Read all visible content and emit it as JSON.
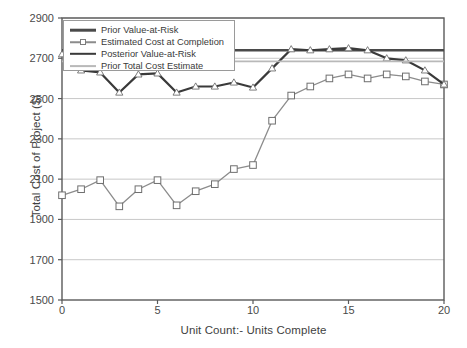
{
  "chart_data": {
    "type": "line",
    "title": "",
    "xlabel": "Unit Count:- Units Complete",
    "ylabel": "Total Cost of Project ($)",
    "xlim": [
      0,
      20
    ],
    "ylim": [
      1500,
      2900
    ],
    "xticks": [
      0,
      5,
      10,
      15,
      20
    ],
    "yticks": [
      1500,
      1700,
      1900,
      2100,
      2300,
      2500,
      2700,
      2900
    ],
    "grid": true,
    "legend_position": "top-left",
    "x": [
      0,
      1,
      2,
      3,
      4,
      5,
      6,
      7,
      8,
      9,
      10,
      11,
      12,
      13,
      14,
      15,
      16,
      17,
      18,
      19,
      20
    ],
    "series": [
      {
        "name": "Prior Value-at-Risk",
        "type": "hline",
        "marker": "none",
        "color": "#4a4a4a",
        "width": 2.4,
        "value": 2740
      },
      {
        "name": "Estimated Cost at Completion",
        "type": "line",
        "marker": "square",
        "color": "#8c8c8c",
        "width": 1.3,
        "values": [
          2020,
          2050,
          2095,
          1965,
          2050,
          2095,
          1970,
          2040,
          2075,
          2150,
          2170,
          2390,
          2515,
          2560,
          2600,
          2620,
          2600,
          2620,
          2610,
          2585,
          2570
        ]
      },
      {
        "name": "Posterior Value-at-Risk",
        "type": "line",
        "marker": "triangle",
        "color": "#3a3a3a",
        "width": 2.2,
        "values": [
          2720,
          2640,
          2630,
          2530,
          2620,
          2625,
          2530,
          2560,
          2560,
          2580,
          2555,
          2650,
          2745,
          2740,
          2745,
          2750,
          2740,
          2700,
          2690,
          2640,
          2570
        ]
      },
      {
        "name": "Prior Total Cost Estimate",
        "type": "hline",
        "marker": "none",
        "color": "#b9b9b9",
        "width": 1.8,
        "value": 2685
      }
    ]
  },
  "plot": {
    "left": 62,
    "right": 444,
    "top": 18,
    "bottom": 300,
    "axis_color": "#5a5a5a",
    "grid_color": "#c8c8c8",
    "background": "#ffffff"
  },
  "legend": {
    "items": [
      "Prior Value-at-Risk",
      "Estimated Cost at Completion",
      "Posterior Value-at-Risk",
      "Prior Total Cost Estimate"
    ]
  }
}
